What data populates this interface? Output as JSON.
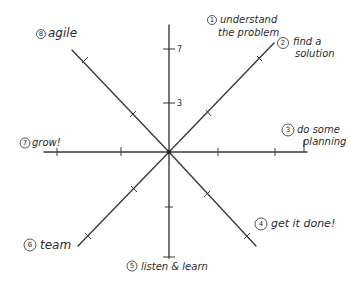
{
  "diagram": {
    "type": "radar-axes",
    "center": {
      "x": 169,
      "y": 152
    },
    "stroke_color": "#3a3a3a",
    "scale_labels": {
      "upper": "7",
      "lower": "3"
    },
    "axes": [
      {
        "number": "1",
        "label_line1": "understand",
        "label_line2": "the problem"
      },
      {
        "number": "2",
        "label_line1": "find a",
        "label_line2": "solution"
      },
      {
        "number": "3",
        "label_line1": "do some",
        "label_line2": "planning"
      },
      {
        "number": "4",
        "label_line1": "get it done!",
        "label_line2": ""
      },
      {
        "number": "5",
        "label_line1": "listen & learn",
        "label_line2": ""
      },
      {
        "number": "6",
        "label_line1": "team",
        "label_line2": ""
      },
      {
        "number": "7",
        "label_line1": "grow!",
        "label_line2": ""
      },
      {
        "number": "8",
        "label_line1": "agile",
        "label_line2": ""
      }
    ]
  }
}
